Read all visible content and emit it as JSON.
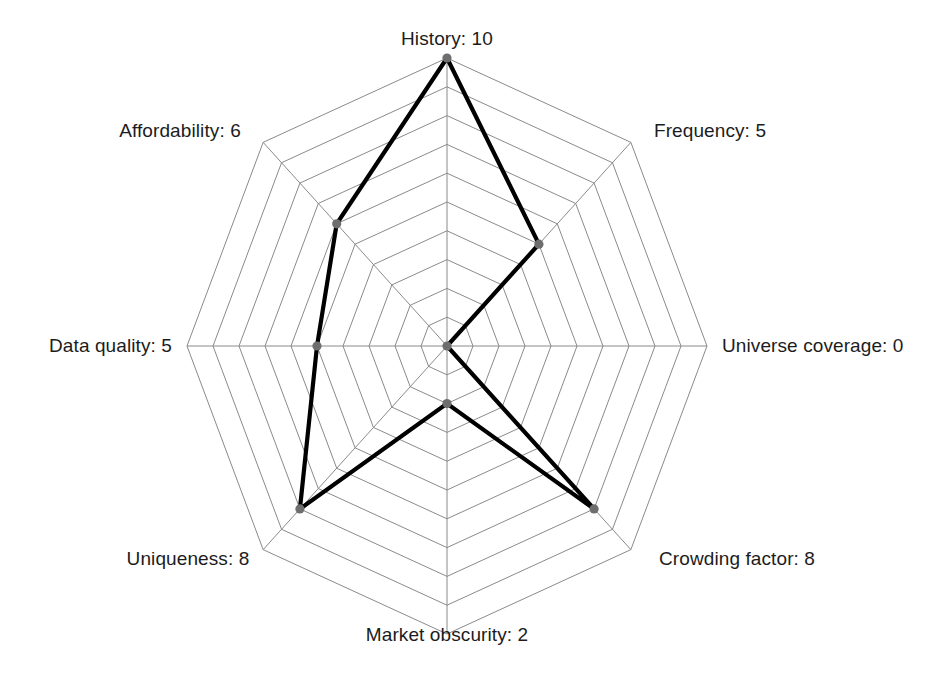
{
  "chart_data": {
    "type": "radar",
    "title": "",
    "categories": [
      "History",
      "Frequency",
      "Universe coverage",
      "Crowding factor",
      "Market obscurity",
      "Uniqueness",
      "Data quality",
      "Affordability"
    ],
    "values": [
      10,
      5,
      0,
      8,
      2,
      8,
      5,
      6
    ],
    "labels": [
      "History: 10",
      "Frequency: 5",
      "Universe coverage: 0",
      "Crowding factor: 8",
      "Market obscurity: 2",
      "Uniqueness: 8",
      "Data quality: 5",
      "Affordability: 6"
    ],
    "rlim": [
      0,
      10
    ],
    "rings": 10,
    "grid": true,
    "legend": "none",
    "xlabel": "",
    "ylabel": "",
    "series": [
      {
        "name": "score",
        "values": [
          10,
          5,
          0,
          8,
          2,
          8,
          5,
          6
        ]
      }
    ],
    "colors": {
      "background": "#ffffff",
      "grid": "#8a8a8a",
      "series_line": "#000000",
      "marker": "#6e6e6e",
      "label_text": "#1c1c1c"
    },
    "geometry": {
      "center_x": 447,
      "center_y": 346,
      "radius_x": 260,
      "radius_y": 288,
      "start_angle_deg": -90,
      "direction": "clockwise"
    }
  },
  "labels_layout": [
    {
      "text": "History: 10",
      "x": 447,
      "y": 50,
      "cls": "lbl-top"
    },
    {
      "text": "Frequency: 5",
      "x": 710,
      "y": 142,
      "cls": "lbl-tr"
    },
    {
      "text": "Universe coverage: 0",
      "x": 722,
      "y": 346,
      "cls": "lbl-right"
    },
    {
      "text": "Crowding factor: 8",
      "x": 737,
      "y": 548,
      "cls": "lbl-br"
    },
    {
      "text": "Market obscurity: 2",
      "x": 447,
      "y": 624,
      "cls": "lbl-bottom"
    },
    {
      "text": "Uniqueness: 8",
      "x": 188,
      "y": 548,
      "cls": "lbl-bl"
    },
    {
      "text": "Data quality: 5",
      "x": 172,
      "y": 346,
      "cls": "lbl-left"
    },
    {
      "text": "Affordability: 6",
      "x": 180,
      "y": 142,
      "cls": "lbl-tl"
    }
  ]
}
